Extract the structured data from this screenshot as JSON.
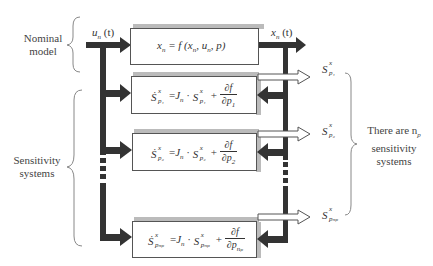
{
  "labels": {
    "nominal_model": "Nominal model",
    "sensitivity_systems": "Sensitivity systems",
    "there_are": "There are n",
    "there_are_sub": "p",
    "sensitivity": "sensitivity",
    "systems": "systems"
  },
  "signals": {
    "input": "u",
    "input_sub": "n",
    "input_arg": "(t)",
    "output": "x",
    "output_sub": "n",
    "output_arg": "(t)"
  },
  "nominal_box": {
    "equation": "x",
    "eq_sub": "n",
    "eq_rest": " = f (x",
    "eq_sub2": "n",
    "eq_comma": ", u",
    "eq_sub3": "n",
    "eq_end": ", p)"
  },
  "sensitivity_boxes": [
    {
      "lhs": "Ṡ",
      "sup": "x",
      "sub": "p₁",
      "J": "J",
      "J_sub": "n",
      "S": "S",
      "num": "∂f",
      "den": "∂p",
      "den_sub": "1"
    },
    {
      "lhs": "Ṡ",
      "sup": "x",
      "sub": "p₂",
      "J": "J",
      "J_sub": "n",
      "S": "S",
      "num": "∂f",
      "den": "∂p",
      "den_sub": "2"
    },
    {
      "lhs": "Ṡ",
      "sup": "x",
      "sub": "pₙₚ",
      "J": "J",
      "J_sub": "n",
      "S": "S",
      "num": "∂f",
      "den": "∂p",
      "den_sub": "nₚ"
    }
  ],
  "outputs": [
    {
      "S": "S",
      "sup": "x",
      "sub": "p₁"
    },
    {
      "S": "S",
      "sup": "x",
      "sub": "p₂"
    },
    {
      "S": "S",
      "sup": "x",
      "sub": "pₙₚ"
    }
  ],
  "colors": {
    "arrow_fill": "#333333",
    "box_border": "#555555",
    "shadow": "#bbbbbb",
    "brace": "#888888"
  }
}
